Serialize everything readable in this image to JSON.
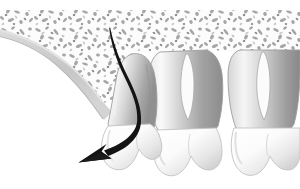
{
  "figure": {
    "width": 300,
    "height": 189,
    "background": "#ffffff"
  },
  "palette": {
    "background": "#ffffff",
    "bone_matrix": "#fbfbfb",
    "trabecula_light": "#b8b8b8",
    "trabecula_mid": "#9a9a9a",
    "trabecula_dark": "#7d7d7d",
    "cortical_band": "#c9c9c9",
    "cortical_band_edge": "#d8d8d8",
    "root_light": "#f2f2f2",
    "root_mid": "#c4c4c4",
    "root_dark": "#8f8f8f",
    "root_outline": "#9d9d9d",
    "crown_light": "#ffffff",
    "crown_shadow": "#dcdcdc",
    "crown_outline": "#bdbdbd",
    "arrow": "#1a1a1a"
  },
  "elements": {
    "bone": {
      "name": "trabecular bone",
      "label": "Cancellous (trabecular) bone"
    },
    "cortical": {
      "name": "cortical band",
      "label": "Cortical bone / gingival margin"
    },
    "arrow": {
      "name": "eruption arrow",
      "label": "Eruption direction",
      "start": [
        110,
        28
      ],
      "end": [
        84,
        157
      ],
      "head_angle_deg": 215
    },
    "teeth": [
      {
        "id": "tooth-left",
        "label": "Tilted erupting molar",
        "roots": 1,
        "crown_center": [
          120,
          140
        ],
        "tilted": true
      },
      {
        "id": "tooth-middle",
        "label": "Erupted molar",
        "roots": 2,
        "crown_center": [
          192,
          148
        ],
        "tilted": false
      },
      {
        "id": "tooth-right",
        "label": "Erupted molar",
        "roots": 2,
        "crown_center": [
          262,
          150
        ],
        "tilted": false
      }
    ]
  }
}
